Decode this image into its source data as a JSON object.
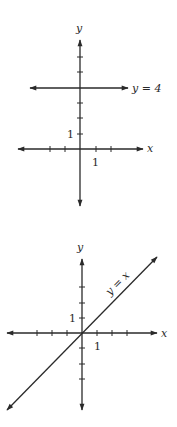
{
  "graph1": {
    "x_axis_label": "x",
    "y_axis_label": "y",
    "x_unit_label": "1",
    "y_unit_label": "1",
    "line_label": "y = 4",
    "line_equation": "y = 4"
  },
  "graph2": {
    "x_axis_label": "x",
    "y_axis_label": "y",
    "x_unit_label": "1",
    "y_unit_label": "1",
    "line_label": "y = x",
    "line_equation": "y = x"
  },
  "colors": {
    "ink": "#2a2a2a",
    "background": "#ffffff"
  }
}
